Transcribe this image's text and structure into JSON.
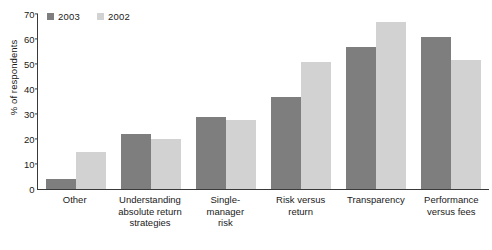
{
  "chart_data": {
    "type": "bar",
    "title": "",
    "xlabel": "",
    "ylabel": "% of respondents",
    "ylim": [
      0,
      70
    ],
    "yticks": [
      0,
      10,
      20,
      30,
      40,
      50,
      60,
      70
    ],
    "grid": false,
    "legend_position": "top-left",
    "categories": [
      "Other",
      "Understanding absolute return strategies",
      "Single-manager risk",
      "Risk versus return",
      "Transparency",
      "Performance versus fees"
    ],
    "category_lines": [
      [
        "Other"
      ],
      [
        "Understanding",
        "absolute return",
        "strategies"
      ],
      [
        "Single-",
        "manager",
        "risk"
      ],
      [
        "Risk versus",
        "return"
      ],
      [
        "Transparency"
      ],
      [
        "Performance",
        "versus fees"
      ]
    ],
    "series": [
      {
        "name": "2003",
        "color": "#7e7e7e",
        "values": [
          4,
          22,
          29,
          37,
          57,
          61
        ]
      },
      {
        "name": "2002",
        "color": "#d2d2d2",
        "values": [
          15,
          20,
          27.5,
          51,
          67,
          51.5
        ]
      }
    ]
  }
}
